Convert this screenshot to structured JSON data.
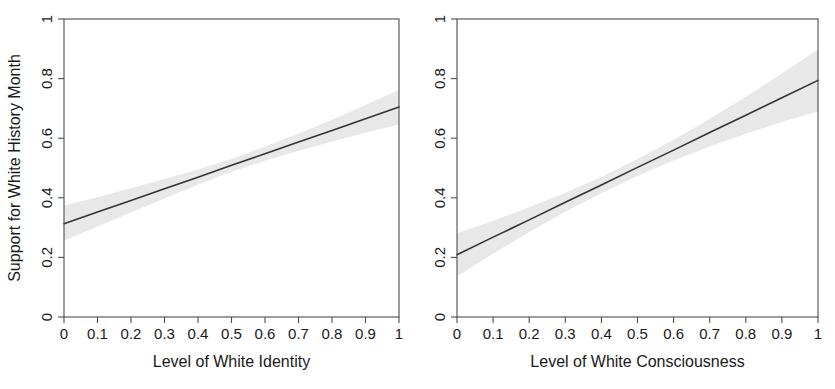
{
  "figure": {
    "background": "#ffffff",
    "line_color": "#333333",
    "band_color": "#e8e8e8",
    "axis_color": "#4d4d4d"
  },
  "chart_data": [
    {
      "type": "line",
      "panel": "left",
      "title": "",
      "xlabel": "Level of White Identity",
      "ylabel": "Support for White History Month",
      "xlim": [
        0,
        1
      ],
      "ylim": [
        0,
        1
      ],
      "grid": false,
      "legend": "none",
      "xticks": [
        "0",
        "0.1",
        "0.2",
        "0.3",
        "0.4",
        "0.5",
        "0.6",
        "0.7",
        "0.8",
        "0.9",
        "1"
      ],
      "xtick_values": [
        0,
        0.1,
        0.2,
        0.3,
        0.4,
        0.5,
        0.6,
        0.7,
        0.8,
        0.9,
        1
      ],
      "yticks": [
        "0",
        "0.2",
        "0.4",
        "0.6",
        "0.8",
        "1"
      ],
      "ytick_values": [
        0,
        0.2,
        0.4,
        0.6,
        0.8,
        1
      ],
      "series": [
        {
          "name": "Predicted support",
          "x": [
            0,
            0.1,
            0.2,
            0.3,
            0.4,
            0.5,
            0.6,
            0.7,
            0.8,
            0.9,
            1
          ],
          "values": [
            0.313,
            0.352,
            0.391,
            0.43,
            0.469,
            0.509,
            0.548,
            0.587,
            0.626,
            0.665,
            0.705
          ]
        }
      ],
      "confidence_band": {
        "name": "95% confidence interval",
        "x": [
          0,
          0.1,
          0.2,
          0.3,
          0.4,
          0.5,
          0.6,
          0.7,
          0.8,
          0.9,
          1
        ],
        "lower": [
          0.256,
          0.304,
          0.351,
          0.398,
          0.444,
          0.487,
          0.524,
          0.558,
          0.589,
          0.618,
          0.646
        ],
        "upper": [
          0.374,
          0.402,
          0.432,
          0.463,
          0.495,
          0.53,
          0.572,
          0.616,
          0.662,
          0.711,
          0.762
        ]
      }
    },
    {
      "type": "line",
      "panel": "right",
      "title": "",
      "xlabel": "Level of White Consciousness",
      "ylabel": "",
      "xlim": [
        0,
        1
      ],
      "ylim": [
        0,
        1
      ],
      "grid": false,
      "legend": "none",
      "xticks": [
        "0",
        "0.1",
        "0.2",
        "0.3",
        "0.4",
        "0.5",
        "0.6",
        "0.7",
        "0.8",
        "0.9",
        "1"
      ],
      "xtick_values": [
        0,
        0.1,
        0.2,
        0.3,
        0.4,
        0.5,
        0.6,
        0.7,
        0.8,
        0.9,
        1
      ],
      "yticks": [
        "0",
        "0.2",
        "0.4",
        "0.6",
        "0.8",
        "1"
      ],
      "ytick_values": [
        0,
        0.2,
        0.4,
        0.6,
        0.8,
        1
      ],
      "series": [
        {
          "name": "Predicted support",
          "x": [
            0,
            0.1,
            0.2,
            0.3,
            0.4,
            0.5,
            0.6,
            0.7,
            0.8,
            0.9,
            1
          ],
          "values": [
            0.209,
            0.268,
            0.326,
            0.385,
            0.443,
            0.502,
            0.56,
            0.619,
            0.677,
            0.736,
            0.794
          ]
        }
      ],
      "confidence_band": {
        "name": "95% confidence interval",
        "x": [
          0,
          0.1,
          0.2,
          0.3,
          0.4,
          0.5,
          0.6,
          0.7,
          0.8,
          0.9,
          1
        ],
        "lower": [
          0.136,
          0.213,
          0.285,
          0.353,
          0.415,
          0.473,
          0.525,
          0.572,
          0.615,
          0.654,
          0.69
        ],
        "upper": [
          0.281,
          0.323,
          0.368,
          0.417,
          0.47,
          0.53,
          0.595,
          0.665,
          0.739,
          0.817,
          0.898
        ]
      }
    }
  ]
}
